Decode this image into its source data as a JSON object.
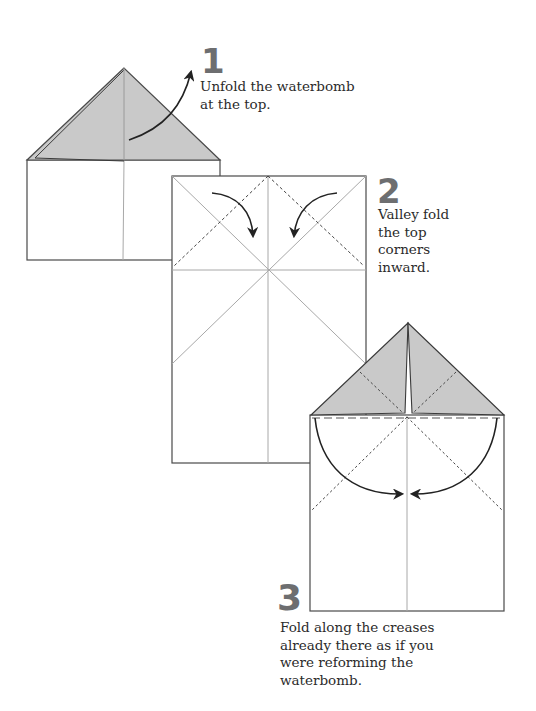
{
  "colors": {
    "paper": "#ffffff",
    "outline": "#4a4a4a",
    "crease": "#a8a8a8",
    "shade": "#c9c9c9",
    "arrow": "#222222",
    "step_number": "#6d6e70",
    "text": "#2b2b2b"
  },
  "steps": [
    {
      "number": "1",
      "lines": [
        "Unfold the waterbomb",
        "at the top."
      ]
    },
    {
      "number": "2",
      "lines": [
        "Valley fold",
        "the top",
        "corners",
        "inward."
      ]
    },
    {
      "number": "3",
      "lines": [
        "Fold along the creases",
        "already there as if you",
        "were reforming the",
        "waterbomb."
      ]
    }
  ],
  "icons": {
    "step1_arrow": "curved-unfold-arrow",
    "step2_arrows": "valley-fold-arrows",
    "step3_arrows": "semicircle-fold-arrows"
  }
}
